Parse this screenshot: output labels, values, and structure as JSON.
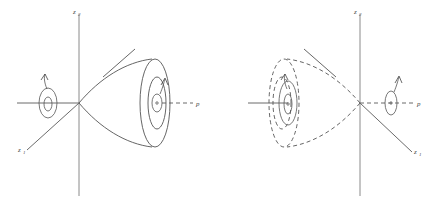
{
  "figure": {
    "background_color": "#ffffff",
    "stroke_color": "#555555",
    "axis_color": "#8a8a8a",
    "label_color": "#4a4a4a"
  },
  "panels": [
    {
      "id": "left-panel",
      "name": "unstable-cone-panel",
      "cone_style": "solid",
      "cone_direction": "right",
      "labels": {
        "vertical_axis": "z",
        "vertical_axis_sub": "2",
        "diagonal_axis": "z",
        "diagonal_axis_sub": "1",
        "horizontal_axis": "p"
      },
      "vortices": [
        {
          "name": "left-vortex",
          "arrow_direction": "counterclockwise"
        },
        {
          "name": "right-vortex",
          "arrow_direction": "clockwise"
        }
      ]
    },
    {
      "id": "right-panel",
      "name": "stable-cone-panel",
      "cone_style": "dashed",
      "cone_direction": "left",
      "labels": {
        "vertical_axis": "z",
        "vertical_axis_sub": "2",
        "diagonal_axis": "z",
        "diagonal_axis_sub": "1",
        "horizontal_axis": "p"
      },
      "vortices": [
        {
          "name": "left-vortex",
          "arrow_direction": "counterclockwise"
        },
        {
          "name": "right-vortex",
          "arrow_direction": "clockwise"
        }
      ]
    }
  ]
}
